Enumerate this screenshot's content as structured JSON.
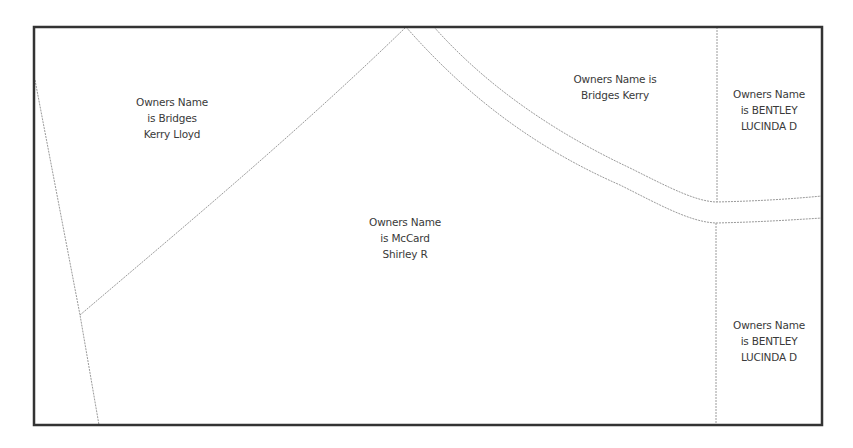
{
  "map": {
    "frame_color": "#333333",
    "parcel_line_color": "#9a9a9a",
    "parcels": [
      {
        "id": "parcel-bridges-kerry-lloyd",
        "label_lines": [
          "Owners Name",
          "is Bridges",
          "Kerry Lloyd"
        ],
        "label_center": [
          172,
          94
        ]
      },
      {
        "id": "parcel-bridges-kerry",
        "label_lines": [
          "Owners Name is",
          "Bridges Kerry"
        ],
        "label_center": [
          615,
          72
        ]
      },
      {
        "id": "parcel-bentley-lucinda-north",
        "label_lines": [
          "Owners Name",
          "is BENTLEY",
          "LUCINDA D"
        ],
        "label_center": [
          769,
          87
        ]
      },
      {
        "id": "parcel-mccard-shirley-r",
        "label_lines": [
          "Owners Name",
          "is McCard",
          "Shirley R"
        ],
        "label_center": [
          405,
          215
        ]
      },
      {
        "id": "parcel-bentley-lucinda-south",
        "label_lines": [
          "Owners Name",
          "is BENTLEY",
          "LUCINDA D"
        ],
        "label_center": [
          769,
          318
        ]
      }
    ]
  }
}
